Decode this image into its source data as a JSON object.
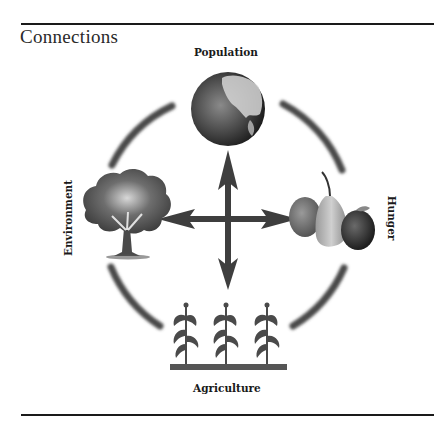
{
  "title": "Connections",
  "nodes": {
    "top": {
      "label": "Population",
      "icon": "globe-icon"
    },
    "left": {
      "label": "Environment",
      "icon": "tree-icon"
    },
    "right": {
      "label": "Hunger",
      "icon": "fruit-icon"
    },
    "bottom": {
      "label": "Agriculture",
      "icon": "corn-crops-icon"
    }
  },
  "connectors": {
    "center": "four-way-arrow-icon",
    "ring": "circular-arc-segments"
  },
  "colors": {
    "ink": "#3a3a3a",
    "rule": "#1a1a1a",
    "background": "#ffffff"
  }
}
